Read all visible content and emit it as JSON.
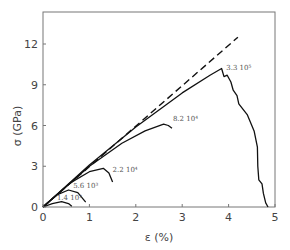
{
  "chart_data": {
    "type": "line",
    "title": "",
    "xlabel": "ε (%)",
    "ylabel": "σ (GPa)",
    "xlim": [
      0,
      5
    ],
    "ylim": [
      0,
      14
    ],
    "xticks": [
      0,
      1,
      2,
      3,
      4,
      5
    ],
    "yticks": [
      0,
      3,
      6,
      9,
      12
    ],
    "grid": false,
    "legend": "none (curves labeled inline)",
    "reference_line": {
      "style": "dashed",
      "points": [
        [
          0,
          0
        ],
        [
          4.2,
          12.5
        ]
      ]
    },
    "series": [
      {
        "name": "1.4 10³",
        "label": "1.4 10³",
        "points": [
          [
            0,
            0
          ],
          [
            0.2,
            0.25
          ],
          [
            0.4,
            0.4
          ],
          [
            0.55,
            0.25
          ],
          [
            0.62,
            0.05
          ]
        ],
        "label_pos": [
          0.3,
          0.5
        ]
      },
      {
        "name": "5.6 10³",
        "label": "5.6 10³",
        "points": [
          [
            0,
            0
          ],
          [
            0.3,
            0.9
          ],
          [
            0.55,
            1.25
          ],
          [
            0.75,
            1.05
          ],
          [
            0.92,
            0.35
          ]
        ],
        "label_pos": [
          0.65,
          1.4
        ]
      },
      {
        "name": "2.2 10⁴",
        "label": "2.2 10⁴",
        "points": [
          [
            0,
            0
          ],
          [
            0.6,
            1.8
          ],
          [
            1.0,
            2.6
          ],
          [
            1.3,
            2.85
          ],
          [
            1.42,
            2.5
          ],
          [
            1.5,
            1.85
          ]
        ],
        "label_pos": [
          1.5,
          2.6
        ]
      },
      {
        "name": "8.2 10⁴",
        "label": "8.2 10⁴",
        "points": [
          [
            0,
            0
          ],
          [
            1.0,
            3.0
          ],
          [
            1.7,
            4.7
          ],
          [
            2.2,
            5.6
          ],
          [
            2.6,
            6.1
          ],
          [
            2.7,
            6.0
          ],
          [
            2.78,
            5.8
          ]
        ],
        "label_pos": [
          2.8,
          6.3
        ]
      },
      {
        "name": "3.3 10⁵",
        "label": "3.3 10⁵",
        "points": [
          [
            0,
            0
          ],
          [
            1.0,
            3.1
          ],
          [
            2.0,
            5.9
          ],
          [
            3.0,
            8.4
          ],
          [
            3.6,
            9.7
          ],
          [
            3.85,
            10.2
          ],
          [
            3.9,
            9.6
          ],
          [
            3.97,
            9.7
          ],
          [
            4.05,
            9.2
          ],
          [
            4.1,
            8.6
          ],
          [
            4.18,
            8.2
          ],
          [
            4.22,
            7.6
          ],
          [
            4.4,
            6.8
          ],
          [
            4.55,
            5.6
          ],
          [
            4.62,
            4.4
          ],
          [
            4.63,
            3.0
          ],
          [
            4.65,
            2.0
          ],
          [
            4.72,
            1.7
          ],
          [
            4.75,
            1.0
          ],
          [
            4.8,
            0.3
          ],
          [
            4.85,
            0
          ]
        ],
        "label_pos": [
          3.95,
          10.1
        ]
      }
    ]
  },
  "axes": {
    "x_title": "ε (%)",
    "y_title": "σ (GPa)",
    "x_tick_labels": [
      "0",
      "1",
      "2",
      "3",
      "4",
      "5"
    ],
    "y_tick_labels": [
      "0",
      "3",
      "6",
      "9",
      "12"
    ]
  }
}
